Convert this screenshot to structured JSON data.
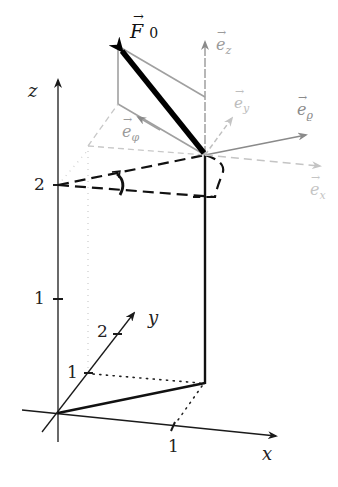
{
  "diagram": {
    "type": "3d-coordinate-sketch",
    "axes": {
      "x": {
        "label": "x",
        "ticks": [
          "1"
        ]
      },
      "y": {
        "label": "y",
        "ticks": [
          "1",
          "2"
        ]
      },
      "z": {
        "label": "z",
        "ticks": [
          "1",
          "2"
        ]
      }
    },
    "vectors": {
      "force": {
        "label": "F",
        "subscript": "0",
        "color": "#000000"
      },
      "basis": [
        {
          "name": "e_z",
          "label": "e",
          "subscript": "z",
          "color": "#9a9a9a"
        },
        {
          "name": "e_y",
          "label": "e",
          "subscript": "y",
          "color": "#bdbdbd"
        },
        {
          "name": "e_rho",
          "label": "e",
          "subscript": "ϱ",
          "color": "#8a8a8a"
        },
        {
          "name": "e_x",
          "label": "e",
          "subscript": "x",
          "color": "#c4c4c4"
        },
        {
          "name": "e_phi",
          "label": "e",
          "subscript": "φ",
          "color": "#9a9a9a"
        }
      ]
    },
    "colors": {
      "axis": "#1a1a1a",
      "path": "#111111",
      "construction": "#a8a8a8",
      "faint": "#cfcfcf"
    }
  }
}
